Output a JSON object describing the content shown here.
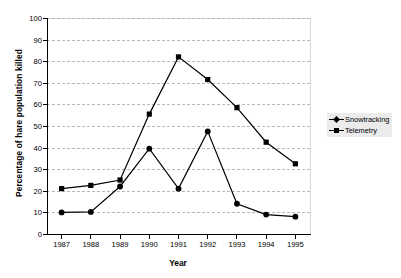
{
  "chart_data": {
    "type": "line",
    "title": "",
    "xlabel": "Year",
    "ylabel": "Percentage of hare population killed",
    "categories": [
      "1987",
      "1988",
      "1989",
      "1990",
      "1991",
      "1992",
      "1993",
      "1994",
      "1995"
    ],
    "x": [
      1987,
      1988,
      1989,
      1990,
      1991,
      1992,
      1993,
      1994,
      1995
    ],
    "series": [
      {
        "name": "Snowtracking",
        "marker": "diamond",
        "values": [
          10.0,
          10.2,
          22.0,
          39.5,
          21.0,
          47.5,
          14.0,
          9.0,
          8.0
        ]
      },
      {
        "name": "Telemetry",
        "marker": "square",
        "values": [
          21.0,
          22.5,
          25.0,
          55.5,
          82.0,
          71.5,
          58.5,
          42.5,
          32.5
        ]
      }
    ],
    "ylim": [
      0,
      100
    ],
    "ytick_labels": [
      "0",
      "10",
      "20",
      "30",
      "40",
      "50",
      "60",
      "70",
      "80",
      "90",
      "100"
    ],
    "ytick_values": [
      0,
      10,
      20,
      30,
      40,
      50,
      60,
      70,
      80,
      90,
      100
    ],
    "grid": true,
    "grid_axis": "y",
    "legend_position": "right",
    "line_color": "#000000",
    "grid_color": "#b8b8b8",
    "axis_color": "#000000",
    "legend_background": "#ebebeb"
  }
}
